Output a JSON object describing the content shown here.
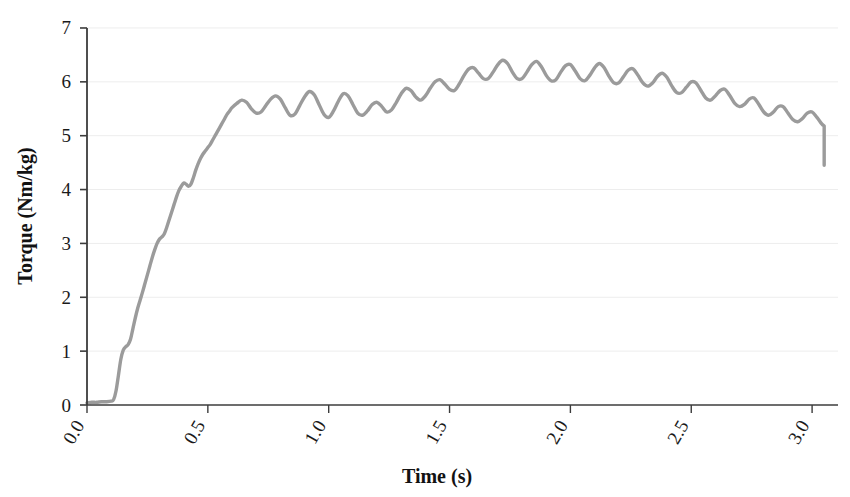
{
  "chart_data": {
    "type": "line",
    "title": "",
    "xlabel": "Time (s)",
    "ylabel": "Torque (Nm/kg)",
    "xlim": [
      0.0,
      3.1
    ],
    "ylim": [
      0,
      7
    ],
    "xticks": [
      "0.0",
      "0.5",
      "1.0",
      "1.5",
      "2.0",
      "2.5",
      "3.0"
    ],
    "xtick_values": [
      0.0,
      0.5,
      1.0,
      1.5,
      2.0,
      2.5,
      3.0
    ],
    "yticks": [
      "0",
      "1",
      "2",
      "3",
      "4",
      "5",
      "6",
      "7"
    ],
    "ytick_values": [
      0,
      1,
      2,
      3,
      4,
      5,
      6,
      7
    ],
    "grid": "horizontal",
    "legend": "none",
    "line_color": "#9b9b9b",
    "line_width": 3.4,
    "axis_color": "#3c3c3c",
    "grid_color": "#ededed",
    "background": "#ffffff",
    "series": [
      {
        "name": "Torque",
        "x": [
          0.0,
          0.02,
          0.04,
          0.06,
          0.08,
          0.1,
          0.11,
          0.12,
          0.13,
          0.14,
          0.15,
          0.16,
          0.17,
          0.18,
          0.19,
          0.2,
          0.21,
          0.22,
          0.23,
          0.24,
          0.25,
          0.26,
          0.27,
          0.28,
          0.29,
          0.3,
          0.31,
          0.32,
          0.33,
          0.34,
          0.35,
          0.36,
          0.37,
          0.38,
          0.39,
          0.4,
          0.41,
          0.42,
          0.43,
          0.44,
          0.45,
          0.46,
          0.47,
          0.48,
          0.49,
          0.5,
          0.51,
          0.52,
          0.53,
          0.54,
          0.55,
          0.56,
          0.57,
          0.58,
          0.59,
          0.6,
          0.62,
          0.64,
          0.66,
          0.68,
          0.7,
          0.72,
          0.74,
          0.76,
          0.78,
          0.8,
          0.82,
          0.84,
          0.86,
          0.88,
          0.9,
          0.92,
          0.94,
          0.96,
          0.98,
          1.0,
          1.02,
          1.04,
          1.06,
          1.08,
          1.1,
          1.12,
          1.14,
          1.16,
          1.18,
          1.2,
          1.22,
          1.24,
          1.26,
          1.28,
          1.3,
          1.32,
          1.34,
          1.36,
          1.38,
          1.4,
          1.42,
          1.44,
          1.46,
          1.48,
          1.5,
          1.52,
          1.54,
          1.56,
          1.58,
          1.6,
          1.62,
          1.64,
          1.66,
          1.68,
          1.7,
          1.72,
          1.74,
          1.76,
          1.78,
          1.8,
          1.82,
          1.84,
          1.86,
          1.88,
          1.9,
          1.92,
          1.94,
          1.96,
          1.98,
          2.0,
          2.02,
          2.04,
          2.06,
          2.08,
          2.1,
          2.12,
          2.14,
          2.16,
          2.18,
          2.2,
          2.22,
          2.24,
          2.26,
          2.28,
          2.3,
          2.32,
          2.34,
          2.36,
          2.38,
          2.4,
          2.42,
          2.44,
          2.46,
          2.48,
          2.5,
          2.52,
          2.54,
          2.56,
          2.58,
          2.6,
          2.62,
          2.64,
          2.66,
          2.68,
          2.7,
          2.72,
          2.74,
          2.76,
          2.78,
          2.8,
          2.82,
          2.84,
          2.86,
          2.88,
          2.9,
          2.92,
          2.94,
          2.96,
          2.98,
          3.0,
          3.02,
          3.04,
          3.05
        ],
        "values": [
          0.04,
          0.05,
          0.05,
          0.06,
          0.06,
          0.07,
          0.1,
          0.26,
          0.55,
          0.85,
          1.02,
          1.08,
          1.12,
          1.22,
          1.42,
          1.62,
          1.8,
          1.95,
          2.1,
          2.26,
          2.42,
          2.58,
          2.74,
          2.88,
          3.0,
          3.08,
          3.12,
          3.18,
          3.3,
          3.44,
          3.58,
          3.72,
          3.86,
          3.98,
          4.06,
          4.12,
          4.1,
          4.06,
          4.1,
          4.22,
          4.36,
          4.48,
          4.58,
          4.66,
          4.72,
          4.78,
          4.84,
          4.92,
          5.0,
          5.08,
          5.16,
          5.24,
          5.32,
          5.4,
          5.46,
          5.52,
          5.6,
          5.66,
          5.62,
          5.5,
          5.42,
          5.44,
          5.56,
          5.68,
          5.74,
          5.68,
          5.52,
          5.38,
          5.4,
          5.56,
          5.72,
          5.82,
          5.76,
          5.58,
          5.4,
          5.34,
          5.46,
          5.64,
          5.78,
          5.74,
          5.58,
          5.42,
          5.38,
          5.46,
          5.58,
          5.62,
          5.54,
          5.44,
          5.48,
          5.62,
          5.78,
          5.88,
          5.84,
          5.72,
          5.66,
          5.74,
          5.88,
          6.0,
          6.04,
          5.96,
          5.86,
          5.84,
          5.96,
          6.12,
          6.24,
          6.26,
          6.16,
          6.06,
          6.06,
          6.18,
          6.32,
          6.4,
          6.34,
          6.18,
          6.06,
          6.06,
          6.18,
          6.32,
          6.38,
          6.28,
          6.12,
          6.02,
          6.04,
          6.18,
          6.3,
          6.32,
          6.2,
          6.06,
          6.02,
          6.12,
          6.26,
          6.34,
          6.26,
          6.1,
          5.98,
          5.98,
          6.1,
          6.22,
          6.24,
          6.12,
          5.98,
          5.92,
          5.98,
          6.1,
          6.16,
          6.08,
          5.92,
          5.8,
          5.8,
          5.9,
          6.0,
          5.98,
          5.84,
          5.7,
          5.66,
          5.74,
          5.84,
          5.86,
          5.74,
          5.6,
          5.54,
          5.58,
          5.68,
          5.7,
          5.58,
          5.44,
          5.38,
          5.44,
          5.54,
          5.54,
          5.42,
          5.3,
          5.26,
          5.32,
          5.42,
          5.44,
          5.34,
          5.22,
          5.18
        ],
        "description": "Isokinetic knee-extension torque trace: zero baseline until ~0.11 s, steep rise to a rippled plateau near 5.5 Nm/kg by 0.6 s, broad peak about 6.4 Nm/kg between 1.3 and 1.6 s, then gradual oscillating decline to roughly 4.8 Nm/kg with a final sharp drop at 3.05 s"
      }
    ],
    "key_points": {
      "onset_time_s": 0.11,
      "peak_value": 6.4,
      "peak_time_s": 1.35,
      "end_value": 4.45,
      "end_time_s": 3.05,
      "oscillation_amplitude": 0.3
    }
  }
}
